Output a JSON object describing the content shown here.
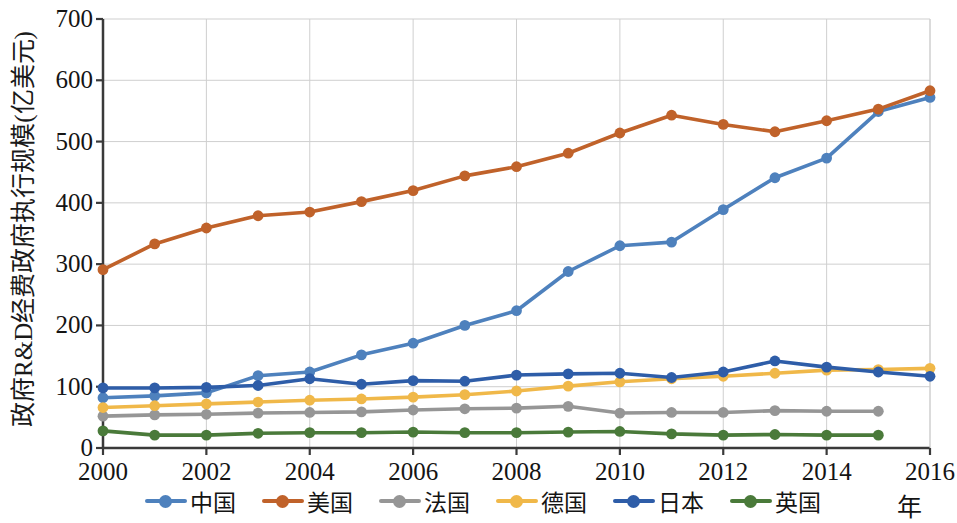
{
  "axis": {
    "y_title": "政府R&D经费政府执行规模(亿美元)",
    "x_unit": "年",
    "y_ticks": [
      "0",
      "100",
      "200",
      "300",
      "400",
      "500",
      "600",
      "700"
    ],
    "x_ticks": [
      "2000",
      "2002",
      "2004",
      "2006",
      "2008",
      "2010",
      "2012",
      "2014",
      "2016"
    ]
  },
  "legend": {
    "items": [
      {
        "label": "中国",
        "color": "#4e81bd"
      },
      {
        "label": "美国",
        "color": "#c0622a"
      },
      {
        "label": "法国",
        "color": "#969696"
      },
      {
        "label": "德国",
        "color": "#f0b849"
      },
      {
        "label": "日本",
        "color": "#2e5da8"
      },
      {
        "label": "英国",
        "color": "#4a7a3a"
      }
    ]
  },
  "chart_data": {
    "type": "line",
    "title": "",
    "xlabel": "年",
    "ylabel": "政府R&D经费政府执行规模(亿美元)",
    "xlim": [
      2000,
      2016
    ],
    "ylim": [
      0,
      700
    ],
    "ytick_step": 100,
    "xtick_step": 2,
    "grid": true,
    "legend_position": "bottom",
    "x": [
      2000,
      2001,
      2002,
      2003,
      2004,
      2005,
      2006,
      2007,
      2008,
      2009,
      2010,
      2011,
      2012,
      2013,
      2014,
      2015,
      2016
    ],
    "series": [
      {
        "name": "中国",
        "color": "#4e81bd",
        "values": [
          82,
          85,
          90,
          118,
          124,
          152,
          171,
          200,
          224,
          288,
          330,
          336,
          389,
          441,
          473,
          549,
          572
        ]
      },
      {
        "name": "美国",
        "color": "#c0622a",
        "values": [
          291,
          333,
          359,
          379,
          385,
          402,
          420,
          444,
          459,
          481,
          514,
          543,
          528,
          516,
          534,
          553,
          583
        ]
      },
      {
        "name": "法国",
        "color": "#969696",
        "values": [
          52,
          54,
          55,
          57,
          58,
          59,
          62,
          64,
          65,
          68,
          57,
          58,
          58,
          61,
          60,
          60,
          null
        ]
      },
      {
        "name": "德国",
        "color": "#f0b849",
        "values": [
          66,
          69,
          72,
          75,
          78,
          80,
          83,
          87,
          93,
          101,
          108,
          113,
          117,
          122,
          127,
          128,
          130
        ]
      },
      {
        "name": "日本",
        "color": "#2e5da8",
        "values": [
          98,
          98,
          99,
          102,
          113,
          104,
          110,
          109,
          119,
          121,
          122,
          115,
          124,
          142,
          132,
          124,
          117
        ]
      },
      {
        "name": "英国",
        "color": "#4a7a3a",
        "values": [
          28,
          21,
          21,
          24,
          25,
          25,
          26,
          25,
          25,
          26,
          27,
          23,
          21,
          22,
          21,
          21,
          null
        ]
      }
    ]
  }
}
